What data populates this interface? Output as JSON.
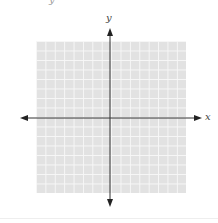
{
  "diagram": {
    "type": "coordinate-plane",
    "x_axis_label": "x",
    "y_axis_label": "y",
    "grid": {
      "columns": 16,
      "rows": 16,
      "fill": "#e2e2e2",
      "line_color": "#f7f7f7"
    },
    "clipped_top_text": "y"
  }
}
